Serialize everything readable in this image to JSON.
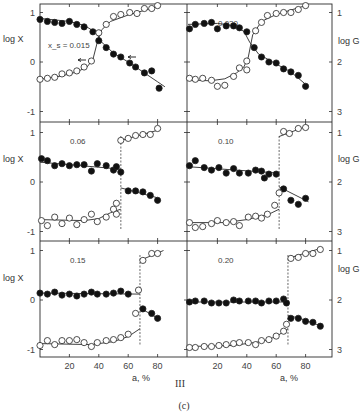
{
  "figure": {
    "roman_label": "III",
    "caption": "(c)",
    "left_axis_label": "log X",
    "right_axis_label": "log G",
    "x_axis_label": "a, %",
    "x_ticks": [
      20,
      40,
      60,
      80
    ],
    "left_y_ticks": [
      1,
      0,
      -1
    ],
    "right_y_ticks": [
      1,
      2,
      3
    ]
  },
  "chart_data": [
    {
      "type": "scatter",
      "panel": "top-left",
      "title": "x_s = 0.015",
      "xlabel": "a, %",
      "ylabel": "log X",
      "xlim": [
        0,
        100
      ],
      "ylim": [
        -1.2,
        1.2
      ],
      "series": [
        {
          "name": "log X (filled)",
          "marker": "filled",
          "x": [
            0,
            5,
            10,
            15,
            20,
            25,
            30,
            36,
            40,
            45,
            50,
            55,
            61,
            65,
            71,
            76,
            81
          ],
          "y": [
            0.86,
            0.82,
            0.8,
            0.78,
            0.82,
            0.76,
            0.71,
            0.61,
            0.43,
            0.29,
            0.16,
            0.1,
            -0.02,
            -0.1,
            -0.22,
            -0.18,
            -0.53
          ]
        },
        {
          "name": "log G (open)",
          "marker": "open",
          "x": [
            0,
            5,
            10,
            15,
            20,
            25,
            30,
            35,
            40,
            45,
            50,
            55,
            61,
            66,
            71,
            76,
            80
          ],
          "y": [
            -0.35,
            -0.33,
            -0.31,
            -0.24,
            -0.22,
            -0.18,
            -0.1,
            0.02,
            0.59,
            0.76,
            0.92,
            0.96,
            1.0,
            0.98,
            1.08,
            1.08,
            1.14
          ]
        }
      ],
      "fit_lines": [
        {
          "name": "filled fit",
          "x": [
            0,
            20,
            30,
            38,
            42,
            50,
            60,
            70,
            80,
            85
          ],
          "y": [
            0.88,
            0.82,
            0.74,
            0.6,
            0.4,
            0.18,
            0.0,
            -0.2,
            -0.4,
            -0.5
          ]
        },
        {
          "name": "open fit",
          "x": [
            0,
            15,
            25,
            32,
            36,
            39,
            42,
            48,
            60,
            80
          ],
          "y": [
            -0.35,
            -0.28,
            -0.2,
            -0.1,
            0.05,
            0.4,
            0.65,
            0.82,
            0.95,
            1.12
          ]
        }
      ],
      "annotations": [
        "arrow at (32, 0.05)",
        "arrow at (61, 0.10)"
      ]
    },
    {
      "type": "scatter",
      "panel": "top-right",
      "title": "0.030",
      "xlabel": "a, %",
      "ylabel": "log G",
      "xlim": [
        0,
        98
      ],
      "ylim": [
        3.2,
        0.8
      ],
      "series": [
        {
          "name": "log X (filled)",
          "marker": "filled",
          "x": [
            1,
            5,
            11,
            16,
            20,
            26,
            31,
            35,
            40,
            45,
            50,
            55,
            60,
            65,
            70,
            75,
            80
          ],
          "y": [
            0.67,
            0.76,
            0.78,
            0.8,
            0.67,
            0.73,
            0.73,
            0.69,
            0.61,
            0.29,
            0.1,
            0.0,
            -0.02,
            -0.14,
            -0.2,
            -0.27,
            -0.49
          ]
        },
        {
          "name": "log G (open)",
          "marker": "open",
          "x": [
            1,
            5,
            10,
            16,
            20,
            25,
            31,
            35,
            40,
            40,
            46,
            50,
            54,
            60,
            65,
            70,
            75,
            80
          ],
          "y": [
            -0.33,
            -0.35,
            -0.33,
            -0.37,
            -0.49,
            -0.47,
            -0.29,
            -0.12,
            -0.16,
            0.02,
            0.63,
            0.8,
            0.94,
            0.98,
            1.0,
            1.0,
            1.06,
            1.14
          ]
        }
      ],
      "fit_lines": [
        {
          "name": "filled fit",
          "x": [
            0,
            20,
            30,
            38,
            42,
            48,
            60,
            70,
            80
          ],
          "y": [
            0.76,
            0.78,
            0.74,
            0.62,
            0.4,
            0.16,
            -0.04,
            -0.2,
            -0.45
          ]
        },
        {
          "name": "open fit",
          "x": [
            0,
            15,
            25,
            33,
            38,
            41,
            44,
            50,
            60,
            80
          ],
          "y": [
            -0.36,
            -0.38,
            -0.34,
            -0.22,
            -0.1,
            0.1,
            0.55,
            0.82,
            0.96,
            1.14
          ]
        }
      ]
    },
    {
      "type": "scatter",
      "panel": "middle-left",
      "title": "0.06",
      "xlabel": "a, %",
      "ylabel": "log X",
      "xlim": [
        0,
        100
      ],
      "ylim": [
        -1.2,
        1.2
      ],
      "series": [
        {
          "name": "log X (filled)",
          "marker": "filled",
          "x": [
            1,
            5,
            10,
            15,
            20,
            25,
            30,
            35,
            39,
            45,
            50,
            52,
            55,
            60,
            65,
            70,
            75,
            80
          ],
          "y": [
            0.47,
            0.43,
            0.33,
            0.37,
            0.33,
            0.35,
            0.35,
            0.22,
            0.37,
            0.33,
            0.24,
            0.31,
            0.2,
            -0.18,
            -0.18,
            -0.2,
            -0.27,
            -0.37
          ]
        },
        {
          "name": "log G (open)",
          "marker": "open",
          "x": [
            1,
            5,
            10,
            15,
            20,
            25,
            30,
            35,
            39,
            45,
            50,
            52,
            52,
            55,
            60,
            65,
            70,
            75,
            80
          ],
          "y": [
            -0.78,
            -0.88,
            -0.71,
            -0.84,
            -0.73,
            -0.86,
            -0.76,
            -0.65,
            -0.8,
            -0.71,
            -0.55,
            -0.43,
            -0.65,
            0.84,
            0.88,
            0.94,
            0.96,
            0.96,
            1.08
          ]
        }
      ],
      "fit_lines": [
        {
          "name": "filled fit low",
          "x": [
            0,
            55
          ],
          "y": [
            0.4,
            0.26
          ]
        },
        {
          "name": "filled fit high",
          "x": [
            55,
            80
          ],
          "y": [
            -0.12,
            -0.32
          ]
        },
        {
          "name": "open fit low",
          "x": [
            0,
            30,
            40,
            48,
            55
          ],
          "y": [
            -0.76,
            -0.78,
            -0.74,
            -0.62,
            -0.55
          ]
        },
        {
          "name": "open fit high",
          "x": [
            55,
            82
          ],
          "y": [
            0.84,
            1.06
          ]
        }
      ],
      "transition_x": 55
    },
    {
      "type": "scatter",
      "panel": "middle-right",
      "title": "0.10",
      "xlabel": "a, %",
      "ylabel": "log G",
      "xlim": [
        0,
        98
      ],
      "ylim": [
        3.2,
        0.8
      ],
      "series": [
        {
          "name": "log X (filled)",
          "marker": "filled",
          "x": [
            1,
            5,
            11,
            16,
            21,
            26,
            31,
            35,
            41,
            46,
            50,
            52,
            55,
            60,
            65,
            70,
            75,
            80
          ],
          "y": [
            0.33,
            0.43,
            0.29,
            0.24,
            0.29,
            0.18,
            0.27,
            0.18,
            0.18,
            0.24,
            0.22,
            0.08,
            0.16,
            0.16,
            -0.14,
            -0.37,
            -0.45,
            -0.33
          ]
        },
        {
          "name": "log G (open)",
          "marker": "open",
          "x": [
            1,
            5,
            10,
            16,
            20,
            26,
            31,
            35,
            41,
            46,
            50,
            54,
            59,
            62,
            65,
            69,
            75,
            80
          ],
          "y": [
            -0.82,
            -0.92,
            -0.9,
            -0.84,
            -0.78,
            -0.82,
            -0.8,
            -0.88,
            -0.71,
            -0.69,
            -0.73,
            -0.65,
            -0.47,
            -0.22,
            1.02,
            0.98,
            1.08,
            1.1
          ]
        }
      ],
      "fit_lines": [
        {
          "name": "filled fit low",
          "x": [
            0,
            62
          ],
          "y": [
            0.31,
            0.18
          ]
        },
        {
          "name": "filled fit high",
          "x": [
            62,
            82
          ],
          "y": [
            -0.1,
            -0.4
          ]
        },
        {
          "name": "open fit low",
          "x": [
            0,
            25,
            40,
            55,
            62
          ],
          "y": [
            -0.82,
            -0.82,
            -0.76,
            -0.65,
            -0.55
          ]
        },
        {
          "name": "open fit high",
          "x": [
            62,
            82
          ],
          "y": [
            0.92,
            1.14
          ]
        }
      ],
      "transition_x": 62
    },
    {
      "type": "scatter",
      "panel": "bottom-left",
      "title": "0.15",
      "xlabel": "a, %",
      "ylabel": "log X",
      "xlim": [
        0,
        100
      ],
      "ylim": [
        -1.2,
        1.2
      ],
      "series": [
        {
          "name": "log X (filled)",
          "marker": "filled",
          "x": [
            0,
            5,
            10,
            15,
            20,
            25,
            30,
            35,
            39,
            45,
            50,
            55,
            60,
            70,
            76,
            80
          ],
          "y": [
            0.14,
            0.12,
            0.16,
            0.1,
            0.12,
            0.08,
            0.12,
            0.16,
            0.12,
            0.12,
            0.14,
            0.18,
            0.12,
            -0.18,
            -0.27,
            -0.37
          ]
        },
        {
          "name": "log G (open)",
          "marker": "open",
          "x": [
            0,
            5,
            10,
            15,
            20,
            25,
            30,
            35,
            39,
            45,
            50,
            55,
            60,
            65,
            67,
            70,
            76,
            80
          ],
          "y": [
            -0.92,
            -0.82,
            -0.9,
            -0.82,
            -0.82,
            -0.8,
            -0.86,
            -0.94,
            -0.86,
            -0.82,
            -0.8,
            -0.76,
            -0.69,
            -0.27,
            0.2,
            0.8,
            0.94,
            0.94
          ]
        }
      ],
      "fit_lines": [
        {
          "name": "filled fit low",
          "x": [
            0,
            68
          ],
          "y": [
            0.14,
            0.12
          ]
        },
        {
          "name": "filled fit high",
          "x": [
            68,
            82
          ],
          "y": [
            -0.16,
            -0.4
          ]
        },
        {
          "name": "open fit low",
          "x": [
            0,
            35,
            50,
            60,
            68
          ],
          "y": [
            -0.88,
            -0.9,
            -0.84,
            -0.74,
            -0.58
          ]
        },
        {
          "name": "open fit high",
          "x": [
            68,
            84
          ],
          "y": [
            0.8,
            1.0
          ]
        }
      ],
      "transition_x": 68
    },
    {
      "type": "scatter",
      "panel": "bottom-right",
      "title": "0.20",
      "xlabel": "a, %",
      "ylabel": "log G",
      "xlim": [
        0,
        98
      ],
      "ylim": [
        3.2,
        0.8
      ],
      "series": [
        {
          "name": "log X (filled)",
          "marker": "filled",
          "x": [
            1,
            5,
            11,
            16,
            21,
            26,
            31,
            35,
            41,
            46,
            50,
            55,
            60,
            65,
            67,
            70,
            75,
            80,
            85,
            90
          ],
          "y": [
            -0.04,
            -0.02,
            -0.02,
            -0.06,
            -0.06,
            -0.06,
            0.0,
            -0.02,
            -0.02,
            -0.02,
            -0.06,
            -0.02,
            -0.02,
            0.02,
            -0.06,
            -0.37,
            -0.37,
            -0.43,
            -0.45,
            -0.53
          ]
        },
        {
          "name": "log G (open)",
          "marker": "open",
          "x": [
            1,
            5,
            11,
            16,
            21,
            26,
            31,
            35,
            41,
            46,
            50,
            55,
            60,
            65,
            67,
            70,
            75,
            80,
            85,
            90
          ],
          "y": [
            -0.96,
            -0.96,
            -0.94,
            -0.94,
            -0.92,
            -0.9,
            -0.88,
            -0.86,
            -0.86,
            -0.9,
            -0.82,
            -0.8,
            -0.73,
            -0.63,
            -0.49,
            0.84,
            0.86,
            0.94,
            0.94,
            1.02
          ]
        }
      ],
      "fit_lines": [
        {
          "name": "filled fit low",
          "x": [
            0,
            68
          ],
          "y": [
            -0.04,
            -0.04
          ]
        },
        {
          "name": "filled fit high",
          "x": [
            68,
            75,
            90
          ],
          "y": [
            -0.32,
            -0.36,
            -0.52
          ]
        },
        {
          "name": "open fit low",
          "x": [
            0,
            30,
            50,
            60,
            68
          ],
          "y": [
            -0.94,
            -0.92,
            -0.84,
            -0.74,
            -0.58
          ]
        },
        {
          "name": "open fit high",
          "x": [
            68,
            90
          ],
          "y": [
            0.84,
            1.04
          ]
        }
      ],
      "transition_x": 68
    }
  ]
}
